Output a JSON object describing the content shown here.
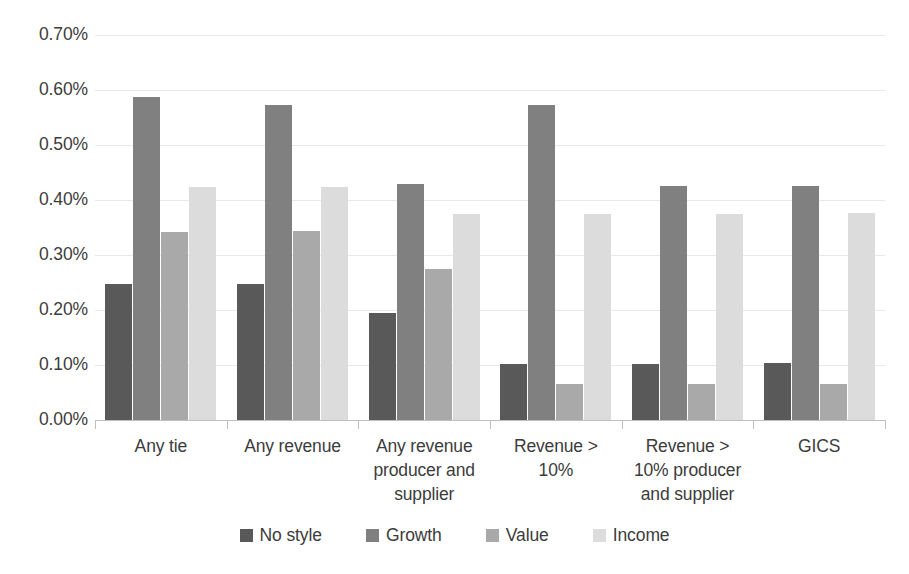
{
  "chart_data": {
    "type": "bar",
    "title": "",
    "subtitle": "",
    "xlabel": "",
    "ylabel": "",
    "ylim": [
      0,
      0.7
    ],
    "ytick_labels": [
      "0.70%",
      "0.60%",
      "0.50%",
      "0.40%",
      "0.30%",
      "0.20%",
      "0.10%",
      "0.00%"
    ],
    "ytick_values": [
      0.7,
      0.6,
      0.5,
      0.4,
      0.3,
      0.2,
      0.1,
      0.0
    ],
    "y_unit": "%",
    "grid": true,
    "legend_position": "bottom",
    "grouping": "grouped",
    "categories": [
      "Any tie",
      "Any revenue",
      "Any revenue producer and supplier",
      "Revenue > 10%",
      "Revenue > 10% producer and supplier",
      "GICS"
    ],
    "category_label_lines": [
      [
        "Any tie"
      ],
      [
        "Any revenue"
      ],
      [
        "Any revenue",
        "producer and",
        "supplier"
      ],
      [
        "Revenue >",
        "10%"
      ],
      [
        "Revenue >",
        "10% producer",
        "and supplier"
      ],
      [
        "GICS"
      ]
    ],
    "series": [
      {
        "name": "No style",
        "color": "#595959",
        "values": [
          0.248,
          0.248,
          0.195,
          0.101,
          0.102,
          0.104
        ]
      },
      {
        "name": "Growth",
        "color": "#808080",
        "values": [
          0.587,
          0.573,
          0.43,
          0.573,
          0.425,
          0.426
        ]
      },
      {
        "name": "Value",
        "color": "#a9a9a9",
        "values": [
          0.341,
          0.344,
          0.275,
          0.065,
          0.065,
          0.066
        ]
      },
      {
        "name": "Income",
        "color": "#dcdcdc",
        "values": [
          0.424,
          0.424,
          0.375,
          0.375,
          0.375,
          0.377
        ]
      }
    ]
  },
  "legend": {
    "items": [
      {
        "label": "No style",
        "color": "#595959"
      },
      {
        "label": "Growth",
        "color": "#808080"
      },
      {
        "label": "Value",
        "color": "#a9a9a9"
      },
      {
        "label": "Income",
        "color": "#dcdcdc"
      }
    ]
  },
  "colors": {
    "background": "#ffffff",
    "gridline": "#e8e8e8",
    "axis": "#bfbfbf",
    "text": "#3c3c3c"
  }
}
